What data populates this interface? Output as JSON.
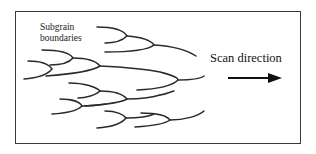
{
  "figure": {
    "type": "schematic",
    "labels": {
      "subgrain_line1": "Subgrain",
      "subgrain_line2": "boundaries",
      "scan_direction": "Scan direction"
    },
    "arrow": {
      "direction": "right",
      "color": "#111111"
    },
    "stroke_color": "#2a2a2a",
    "background": "#ffffff"
  }
}
